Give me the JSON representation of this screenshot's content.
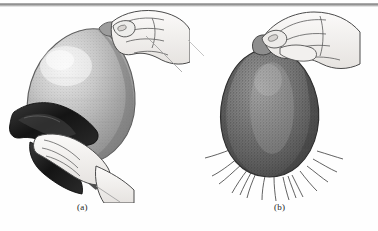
{
  "figure": {
    "panel_a": {
      "label": "(a)",
      "subject": "hand-holding-balloon-rubbed-with-cloth"
    },
    "panel_b": {
      "label": "(b)",
      "subject": "charged-balloon-attracting-hair-strands"
    },
    "caption": "",
    "colors": {
      "background": "#fefefe",
      "rule": "#8d8d8d",
      "ink": "#222222",
      "balloon_a_fill": "#b9b9b9",
      "balloon_b_fill": "#6f6f6f",
      "cloth_fill": "#1c1c1c",
      "skin_fill": "#f4f2f0"
    }
  }
}
